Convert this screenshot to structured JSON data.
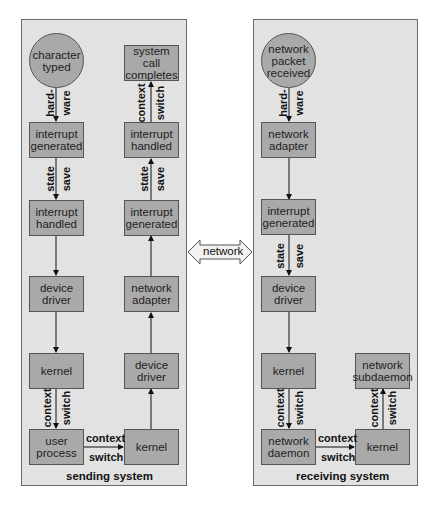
{
  "sending": {
    "caption": "sending system",
    "start": "character typed",
    "left": [
      "interrupt generated",
      "interrupt handled",
      "device driver",
      "kernel",
      "user process"
    ],
    "right": [
      "system call completes",
      "interrupt handled",
      "interrupt generated",
      "network adapter",
      "device driver",
      "kernel"
    ],
    "labels": {
      "hw1": "hard-",
      "hw2": "ware",
      "ss1": "state",
      "ss2": "save",
      "cs1": "context",
      "cs2": "switch",
      "rss1": "state",
      "rss2": "save",
      "rcs1": "context",
      "rcs2": "switch",
      "hcs1": "context",
      "hcs2": "switch"
    }
  },
  "network": {
    "label": "network"
  },
  "receiving": {
    "caption": "receiving system",
    "start": "network packet received",
    "left": [
      "network adapter",
      "interrupt generated",
      "device driver",
      "kernel",
      "network daemon"
    ],
    "right": [
      "network subdaemon",
      "kernel"
    ],
    "labels": {
      "hw1": "hard-",
      "hw2": "ware",
      "ss1": "state",
      "ss2": "save",
      "cs1": "context",
      "cs2": "switch",
      "rcs1": "context",
      "rcs2": "switch",
      "hcs1": "context",
      "hcs2": "switch"
    }
  },
  "colors": {
    "panel": "#e2e2e2",
    "box": "#a9a9a9",
    "border": "#555555"
  }
}
